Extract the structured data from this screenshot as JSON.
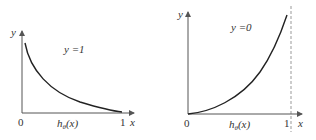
{
  "figure": {
    "panels": [
      {
        "id": "left",
        "condition_label": "y =1",
        "y_axis_label": "y",
        "x_axis_label": "x",
        "origin_label": "0",
        "x_end_label": "1",
        "x_caption": "hθ(x)",
        "curve": "decreasing, -log(h), starts high near 0 and approaches 0 at 1"
      },
      {
        "id": "right",
        "condition_label": "y =0",
        "y_axis_label": "y",
        "x_axis_label": "x",
        "origin_label": "0",
        "x_end_label": "1",
        "x_caption": "hθ(x)",
        "curve": "increasing, -log(1-h), starts at 0 and rises steeply toward asymptote at 1",
        "asymptote": "dashed vertical line at x = 1"
      }
    ]
  },
  "colors": {
    "axis": "#555555",
    "curve": "#222222",
    "dashed": "#999999",
    "text": "#333333"
  }
}
